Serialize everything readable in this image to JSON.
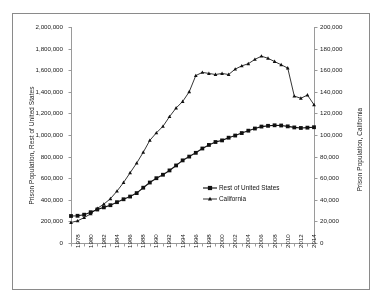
{
  "chart_data": {
    "type": "line",
    "title": "",
    "subtitle": "",
    "xlabel": "",
    "ylabel": "Prison Population, Rest of United States",
    "y2label": "Prison Population, California",
    "grid": false,
    "legend_position": "center-right-inside",
    "xlim": [
      1978,
      2015
    ],
    "ylim": [
      0,
      2000000
    ],
    "y2lim": [
      0,
      200000
    ],
    "x_tick_labels": [
      "1978",
      "1980",
      "1982",
      "1984",
      "1986",
      "1988",
      "1990",
      "1992",
      "1994",
      "1996",
      "1998",
      "2000",
      "2002",
      "2004",
      "2006",
      "2008",
      "2010",
      "2012",
      "2014"
    ],
    "y_tick_labels": [
      "0",
      "200,000",
      "400,000",
      "600,000",
      "800,000",
      "1,000,000",
      "1,200,000",
      "1,400,000",
      "1,600,000",
      "1,800,000",
      "2,000,000"
    ],
    "y2_tick_labels": [
      "0",
      "20,000",
      "40,000",
      "60,000",
      "80,000",
      "100,000",
      "120,000",
      "140,000",
      "160,000",
      "180,000",
      "200,000"
    ],
    "x": [
      1978,
      1979,
      1980,
      1981,
      1982,
      1983,
      1984,
      1985,
      1986,
      1987,
      1988,
      1989,
      1990,
      1991,
      1992,
      1993,
      1994,
      1995,
      1996,
      1997,
      1998,
      1999,
      2000,
      2001,
      2002,
      2003,
      2004,
      2005,
      2006,
      2007,
      2008,
      2009,
      2010,
      2011,
      2012,
      2013,
      2014,
      2015
    ],
    "series": [
      {
        "name": "Rest of United States",
        "axis": "left",
        "marker": "square",
        "color": "#111111",
        "values": [
          250000,
          252000,
          262000,
          285000,
          310000,
          330000,
          350000,
          378000,
          405000,
          430000,
          462000,
          512000,
          560000,
          600000,
          632000,
          672000,
          718000,
          765000,
          800000,
          835000,
          875000,
          908000,
          935000,
          950000,
          975000,
          995000,
          1018000,
          1040000,
          1060000,
          1078000,
          1085000,
          1090000,
          1088000,
          1080000,
          1070000,
          1065000,
          1068000,
          1072000
        ]
      },
      {
        "name": "California",
        "axis": "right",
        "marker": "triangle",
        "color": "#111111",
        "values": [
          19000,
          20500,
          23500,
          27000,
          32000,
          36000,
          41000,
          48000,
          56000,
          65000,
          74000,
          84000,
          95000,
          102000,
          108000,
          117000,
          125000,
          131000,
          140000,
          155000,
          158000,
          157000,
          156000,
          157000,
          156000,
          161000,
          164000,
          166000,
          170000,
          173000,
          171000,
          168000,
          165000,
          162000,
          136000,
          134000,
          137000,
          128000
        ]
      }
    ],
    "annotations": []
  },
  "legend": {
    "items": [
      {
        "label": "Rest of United States",
        "marker": "square"
      },
      {
        "label": "California",
        "marker": "triangle"
      }
    ]
  },
  "axes": {
    "left_title": "Prison Population, Rest of United States",
    "right_title": "Prison Population, California"
  }
}
